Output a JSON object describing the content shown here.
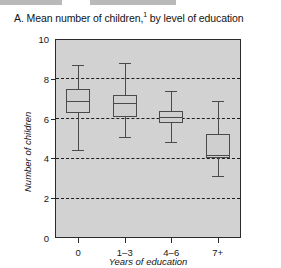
{
  "figure": {
    "panel_letter": "A.",
    "title_main": "A. Mean number of children,",
    "title_footnote_marker": "1",
    "title_tail": " by level of education"
  },
  "chart_data": {
    "type": "box",
    "xlabel": "Years of education",
    "ylabel": "Number of children",
    "categories": [
      "0",
      "1–3",
      "4–6",
      "7+"
    ],
    "yticks": [
      "0",
      "2",
      "4",
      "6",
      "8",
      "10"
    ],
    "ylim": [
      0,
      10
    ],
    "grid": "horizontal-dashed",
    "legend": "none",
    "series": [
      {
        "category": "0",
        "whisker_low": 4.4,
        "q1": 6.3,
        "median": 6.9,
        "q3": 7.5,
        "whisker_high": 8.7
      },
      {
        "category": "1–3",
        "whisker_low": 5.1,
        "q1": 6.1,
        "median": 6.8,
        "q3": 7.2,
        "whisker_high": 8.8
      },
      {
        "category": "4–6",
        "whisker_low": 4.8,
        "q1": 5.8,
        "median": 6.1,
        "q3": 6.4,
        "whisker_high": 7.4
      },
      {
        "category": "7+",
        "whisker_low": 3.1,
        "q1": 4.0,
        "median": 4.15,
        "q3": 5.25,
        "whisker_high": 6.9
      }
    ]
  },
  "colors": {
    "plot_background": "#d2d2d2",
    "axis": "#2b2b2b",
    "box_fill": "#cfcfcf",
    "box_stroke": "#4a4a4a",
    "grid": "#1d1d1d",
    "text": "#161616"
  }
}
